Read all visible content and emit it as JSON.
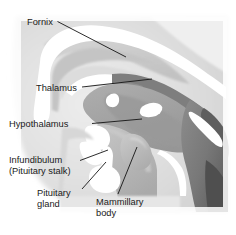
{
  "figure": {
    "kind": "anatomical-illustration",
    "style": "grayscale line-and-tone drawing",
    "width": 236,
    "height": 235,
    "background_color": "#ffffff"
  },
  "labels": [
    {
      "id": "fornix",
      "text": "Fornix",
      "lines": [
        "Fornix"
      ],
      "text_x": 27,
      "text_y": 25,
      "anchor": "start",
      "leader": "M 57.5 21.5 L 126 57",
      "leader_points": [
        [
          57.5,
          21.5
        ],
        [
          126,
          57
        ]
      ],
      "target": "fornix band above thalamus"
    },
    {
      "id": "thalamus",
      "text": "Thalamus",
      "lines": [
        "Thalamus"
      ],
      "text_x": 36,
      "text_y": 91,
      "anchor": "start",
      "leader": "M 82 87 L 152 79",
      "leader_points": [
        [
          82,
          87
        ],
        [
          152,
          79
        ]
      ],
      "target": "thalamic gray mass"
    },
    {
      "id": "hypothalamus",
      "text": "Hypothalamus",
      "lines": [
        "Hypothalamus"
      ],
      "text_x": 9,
      "text_y": 127,
      "anchor": "start",
      "leader": "M 92 123.5 L 142 119",
      "leader_points": [
        [
          92,
          123.5
        ],
        [
          142,
          119
        ]
      ],
      "target": "hypothalamic region below thalamus"
    },
    {
      "id": "infundibulum",
      "text": "Infundibulum (Pituitary stalk)",
      "lines": [
        "Infundibulum",
        "(Pituitary stalk)"
      ],
      "text_x": 9,
      "text_y": 163,
      "anchor": "start",
      "leader": "M 80 160.5 L 108 150",
      "leader_points": [
        [
          80,
          160.5
        ],
        [
          108,
          150
        ]
      ],
      "target": "pituitary stalk"
    },
    {
      "id": "pituitary-gland",
      "text": "Pituitary gland",
      "lines": [
        "Pituitary",
        "gland"
      ],
      "text_x": 37,
      "text_y": 196,
      "anchor": "start",
      "leader": "M 82 189 L 106 162",
      "leader_points": [
        [
          82,
          189
        ],
        [
          106,
          162
        ]
      ],
      "target": "pituitary gland body"
    },
    {
      "id": "mammillary-body",
      "text": "Mammillary body",
      "lines": [
        "Mammillary",
        "body"
      ],
      "text_x": 96,
      "text_y": 205,
      "anchor": "start",
      "leader": "M 118 194 L 137 147",
      "leader_points": [
        [
          118,
          194
        ],
        [
          137,
          147
        ]
      ],
      "target": "mammillary body"
    }
  ],
  "palette": {
    "background": "#ffffff",
    "paper_tint": "#f2f2f2",
    "light_gray": "#e3e3e3",
    "mid_light_gray": "#cfcfcf",
    "mid_gray": "#b4b4b4",
    "tone_gray": "#a3a3a3",
    "dark_gray": "#8a8a8a",
    "darker_gray": "#6f6f6f",
    "deep_gray": "#4f4f4f",
    "white_structure": "#ffffff",
    "leader_stroke": "#141414",
    "text_color": "#1a1a1a"
  },
  "structures": [
    {
      "id": "cerebral-hemisphere-field",
      "tone": "light_gray",
      "note": "broad pale cortical field filling upper-left and surround"
    },
    {
      "id": "corpus-callosum",
      "tone": "white_structure",
      "note": "white arching band across the top, curving down at the left as the genu and rostrum"
    },
    {
      "id": "lateral-ventricle-shadow",
      "tone": "mid_light_gray",
      "note": "soft gray crescent under the corpus callosum"
    },
    {
      "id": "fornix",
      "tone": "white_structure",
      "note": "slender white band arching over the thalamus toward the mammillary body"
    },
    {
      "id": "thalamus",
      "tone": "tone_gray",
      "note": "large oval gray mass in the center"
    },
    {
      "id": "massa-intermedia",
      "tone": "white_structure",
      "note": "small white oval inside the thalamus"
    },
    {
      "id": "third-ventricle-border",
      "tone": "dark_gray",
      "note": "darker scalloped ridge along the upper right edge of the thalamus"
    },
    {
      "id": "hypothalamus",
      "tone": "mid_gray",
      "note": "gray region below and in front of the thalamus"
    },
    {
      "id": "mammillary-body",
      "tone": "mid_gray",
      "note": "rounded prominence at the posterior base of the hypothalamus"
    },
    {
      "id": "infundibulum",
      "tone": "white_structure",
      "note": "narrow white stalk descending from the hypothalamus"
    },
    {
      "id": "pituitary-gland",
      "tone": "white_structure",
      "note": "bulbous white body at the bottom of the stalk"
    },
    {
      "id": "optic-chiasm",
      "tone": "white_structure",
      "note": "white wedge anterior to the infundibulum"
    },
    {
      "id": "midbrain-brainstem",
      "tone": "darker_gray",
      "note": "dark gray mass on the right descending from the thalamus"
    },
    {
      "id": "cerebral-aqueduct",
      "tone": "white_structure",
      "note": "thin white channel through the midbrain"
    },
    {
      "id": "pons-region",
      "tone": "deep_gray",
      "note": "dark tone at the far right lower area"
    }
  ]
}
